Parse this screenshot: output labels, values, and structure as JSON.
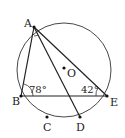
{
  "diagram": {
    "type": "geometry-circle-inscribed",
    "circle": {
      "center_label": "O",
      "cx": 64,
      "cy": 70,
      "r": 47
    },
    "points": [
      {
        "label": "A",
        "x": 34,
        "y": 27,
        "lx": 24,
        "ly": 27
      },
      {
        "label": "B",
        "x": 21,
        "y": 96,
        "lx": 12,
        "ly": 105
      },
      {
        "label": "E",
        "x": 107,
        "y": 96,
        "lx": 110,
        "ly": 106
      },
      {
        "label": "C",
        "x": 47,
        "y": 117,
        "lx": 43,
        "ly": 131
      },
      {
        "label": "D",
        "x": 80,
        "y": 117,
        "lx": 76,
        "ly": 131
      },
      {
        "label": "O",
        "x": 64,
        "y": 68,
        "lx": 67,
        "ly": 77
      }
    ],
    "segments": [
      {
        "from": "A",
        "to": "B"
      },
      {
        "from": "A",
        "to": "E"
      },
      {
        "from": "A",
        "to": "D"
      },
      {
        "from": "B",
        "to": "E"
      }
    ],
    "angles": [
      {
        "vertex": "B",
        "value": "78°",
        "lx": 29,
        "ly": 93
      },
      {
        "vertex": "E",
        "value": "42°",
        "lx": 81,
        "ly": 93
      }
    ]
  }
}
